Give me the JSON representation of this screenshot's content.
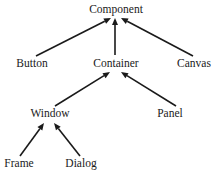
{
  "diagram": {
    "type": "class-hierarchy",
    "nodes": [
      {
        "id": "component",
        "label": "Component"
      },
      {
        "id": "button",
        "label": "Button"
      },
      {
        "id": "container",
        "label": "Container"
      },
      {
        "id": "canvas",
        "label": "Canvas"
      },
      {
        "id": "window",
        "label": "Window"
      },
      {
        "id": "panel",
        "label": "Panel"
      },
      {
        "id": "frame",
        "label": "Frame"
      },
      {
        "id": "dialog",
        "label": "Dialog"
      }
    ],
    "edges": [
      {
        "from": "button",
        "to": "component",
        "relation": "inherits"
      },
      {
        "from": "container",
        "to": "component",
        "relation": "inherits"
      },
      {
        "from": "canvas",
        "to": "component",
        "relation": "inherits"
      },
      {
        "from": "window",
        "to": "container",
        "relation": "inherits"
      },
      {
        "from": "panel",
        "to": "container",
        "relation": "inherits"
      },
      {
        "from": "frame",
        "to": "window",
        "relation": "inherits"
      },
      {
        "from": "dialog",
        "to": "window",
        "relation": "inherits"
      }
    ]
  }
}
